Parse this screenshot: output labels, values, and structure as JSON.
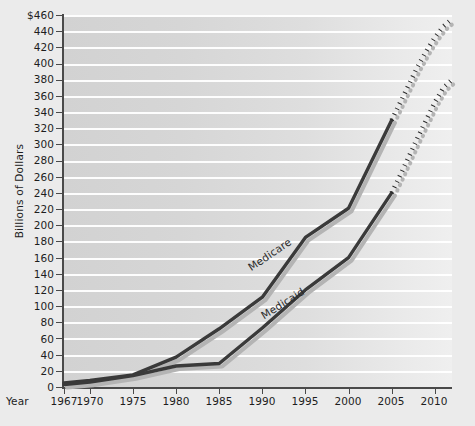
{
  "chart_data": {
    "type": "line",
    "title": "",
    "xlabel": "Year",
    "ylabel": "Billions of Dollars",
    "xlim": [
      1967,
      2012
    ],
    "ylim": [
      0,
      460
    ],
    "grid": true,
    "legend": "inline-series-labels",
    "x_ticks": [
      "1967",
      "1970",
      "1975",
      "1980",
      "1985",
      "1990",
      "1995",
      "2000",
      "2005",
      "2010"
    ],
    "x_tick_values": [
      1967,
      1970,
      1975,
      1980,
      1985,
      1990,
      1995,
      2000,
      2005,
      2010
    ],
    "y_ticks": [
      "0",
      "20",
      "40",
      "60",
      "80",
      "100",
      "120",
      "140",
      "160",
      "180",
      "200",
      "220",
      "240",
      "260",
      "280",
      "300",
      "320",
      "340",
      "360",
      "380",
      "400",
      "420",
      "440",
      "$460"
    ],
    "y_tick_values": [
      0,
      20,
      40,
      60,
      80,
      100,
      120,
      140,
      160,
      180,
      200,
      220,
      240,
      260,
      280,
      300,
      320,
      340,
      360,
      380,
      400,
      420,
      440,
      460
    ],
    "series": [
      {
        "name": "Medicare",
        "color": "#3a3a3a",
        "x": [
          1967,
          1970,
          1975,
          1980,
          1985,
          1990,
          1995,
          2000,
          2005
        ],
        "values": [
          5,
          8,
          15,
          37,
          72,
          111,
          185,
          221,
          330
        ],
        "style": "solid"
      },
      {
        "name": "Medicare",
        "color": "#2b2b2b",
        "x": [
          2005,
          2006,
          2007,
          2008,
          2009,
          2010,
          2011,
          2012
        ],
        "values": [
          330,
          352,
          374,
          396,
          415,
          432,
          446,
          455
        ],
        "style": "dotted",
        "projection": true
      },
      {
        "name": "Medicaid",
        "color": "#3a3a3a",
        "x": [
          1967,
          1970,
          1975,
          1980,
          1985,
          1990,
          1995,
          2000,
          2005
        ],
        "values": [
          3,
          6,
          14,
          26,
          29,
          73,
          120,
          160,
          240
        ],
        "style": "solid"
      },
      {
        "name": "Medicaid",
        "color": "#2b2b2b",
        "x": [
          2005,
          2006,
          2007,
          2008,
          2009,
          2010,
          2011,
          2012
        ],
        "values": [
          240,
          262,
          285,
          308,
          330,
          352,
          370,
          380
        ],
        "style": "dotted",
        "projection": true
      }
    ],
    "annotations": [
      {
        "name": "medicare-label",
        "text": "Medicare"
      },
      {
        "name": "medicaid-label",
        "text": "Medicaid"
      }
    ]
  },
  "axis": {
    "y_title": "Billions of Dollars",
    "x_title": "Year"
  },
  "labels": {
    "medicare": "Medicare",
    "medicaid": "Medicaid"
  },
  "y_labels": {
    "t23": "$460",
    "t22": "440",
    "t21": "420",
    "t20": "400",
    "t19": "380",
    "t18": "360",
    "t17": "340",
    "t16": "320",
    "t15": "300",
    "t14": "280",
    "t13": "260",
    "t12": "240",
    "t11": "220",
    "t10": "200",
    "t9": "180",
    "t8": "160",
    "t7": "140",
    "t6": "120",
    "t5": "100",
    "t4": "80",
    "t3": "60",
    "t2": "40",
    "t1": "20",
    "t0": "0"
  },
  "x_labels": {
    "x0": "1967",
    "x1": "1970",
    "x2": "1975",
    "x3": "1980",
    "x4": "1985",
    "x5": "1990",
    "x6": "1995",
    "x7": "2000",
    "x8": "2005",
    "x9": "2010"
  },
  "colors": {
    "plot_background": "#d6d6d6",
    "page_background": "#ebebeb",
    "gridline": "#ffffff",
    "axis": "#4a4a4a",
    "series_line": "#3a3a3a",
    "text": "#1d1d1d"
  }
}
